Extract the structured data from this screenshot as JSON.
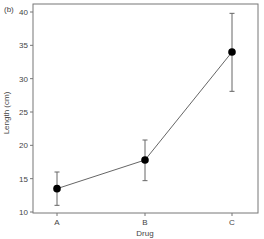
{
  "panel_label": "(b)",
  "chart_data": {
    "type": "line",
    "title": "",
    "panel_label": "(b)",
    "xlabel": "Drug",
    "ylabel": "Length (cm)",
    "categories": [
      "A",
      "B",
      "C"
    ],
    "series": [
      {
        "name": "Mean length",
        "values": [
          13.5,
          17.8,
          34.0
        ],
        "error_upper": [
          16.0,
          20.8,
          39.8
        ],
        "error_lower": [
          11.0,
          14.7,
          28.1
        ],
        "marker": "filled-circle",
        "color": "#000000"
      }
    ],
    "ylim": [
      10,
      41
    ],
    "yticks": [
      10,
      15,
      20,
      25,
      30,
      35,
      40
    ],
    "grid": false,
    "legend": null
  },
  "colors": {
    "axis": "#555555",
    "line": "#666666",
    "marker": "#000000",
    "errorbar": "#666666"
  }
}
